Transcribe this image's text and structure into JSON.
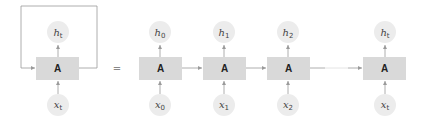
{
  "diagram": {
    "type": "rnn-unrolled",
    "colors": {
      "box": "#d9d9d9",
      "circle": "#ececec",
      "line": "#9a9a9a",
      "text": "#222222"
    },
    "folded": {
      "cell_label": "A",
      "output": {
        "var": "h",
        "sub": "t"
      },
      "input": {
        "var": "x",
        "sub": "t"
      }
    },
    "equals": "=",
    "unrolled": [
      {
        "cell_label": "A",
        "output": {
          "var": "h",
          "sub": "0"
        },
        "input": {
          "var": "x",
          "sub": "0"
        }
      },
      {
        "cell_label": "A",
        "output": {
          "var": "h",
          "sub": "1"
        },
        "input": {
          "var": "x",
          "sub": "1"
        }
      },
      {
        "cell_label": "A",
        "output": {
          "var": "h",
          "sub": "2"
        },
        "input": {
          "var": "x",
          "sub": "2"
        }
      },
      {
        "cell_label": "A",
        "output": {
          "var": "h",
          "sub": "t"
        },
        "input": {
          "var": "x",
          "sub": "t"
        }
      }
    ]
  }
}
